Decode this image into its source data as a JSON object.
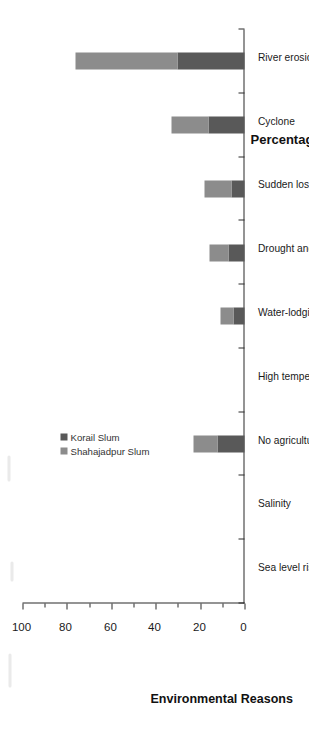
{
  "chart_data": {
    "type": "bar",
    "orientation": "vertical-stacked-rotated",
    "title": "",
    "xlabel": "Environmental Reasons",
    "ylabel": "Percentage (%)",
    "ylim": [
      0,
      100
    ],
    "yticks": [
      0,
      20,
      40,
      60,
      80,
      100
    ],
    "ytick_labels": [
      "0",
      "20",
      "40",
      "60",
      "80",
      "100"
    ],
    "minor_ticks": [
      10,
      30,
      50,
      70,
      90
    ],
    "grid": false,
    "legend_position": "upper-center",
    "stacked": true,
    "categories": [
      "Sea level rise",
      "Salinity",
      "No agricultural work available during the off-season (Monga period)",
      "High temperatures or erratic rainfall",
      "Water-lodging",
      "Drought and a lack of water for irrigation",
      "Sudden loss of their house and/or crops due to flooding",
      "Cyclone",
      "River erosion"
    ],
    "series": [
      {
        "name": "Korail Slum",
        "color": "#595959",
        "values": [
          0,
          0,
          12,
          0,
          5,
          7,
          6,
          16,
          30
        ]
      },
      {
        "name": "Shahajadpur Slum",
        "color": "#8c8c8c",
        "values": [
          0,
          0,
          11,
          0,
          6,
          9,
          12,
          17,
          46
        ]
      }
    ],
    "totals": [
      0,
      0,
      23,
      0,
      11,
      16,
      18,
      33,
      76
    ]
  },
  "legend": {
    "items": [
      {
        "label": "Korail Slum",
        "color": "#595959"
      },
      {
        "label": "Shahajadpur Slum",
        "color": "#8c8c8c"
      }
    ]
  },
  "axes": {
    "value_axis_title": "Percentage (%)",
    "category_axis_title": "Environmental Reasons"
  }
}
